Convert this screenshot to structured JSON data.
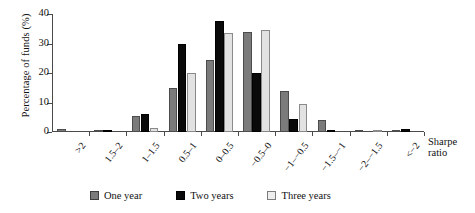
{
  "chart_data": {
    "type": "bar",
    "title": "",
    "xlabel": "Sharpe ratio",
    "ylabel": "Percentage of funds (%)",
    "ylim": [
      0,
      40
    ],
    "yticks": [
      0,
      10,
      20,
      30,
      40
    ],
    "grid": false,
    "legend_position": "bottom",
    "categories": [
      ">2",
      "1.5–2",
      "1–1.5",
      "0.5–1",
      "0–0.5",
      "−0.5–0",
      "−1–−0.5",
      "−1.5–−1",
      "−2–−1.5",
      "<−2"
    ],
    "series": [
      {
        "name": "One year",
        "color": "#7b7b7b",
        "values": [
          1.0,
          0.7,
          5.5,
          15.0,
          24.5,
          34.0,
          14.0,
          4.0,
          0.8,
          0.7
        ]
      },
      {
        "name": "Two years",
        "color": "#0a0a0a",
        "values": [
          0.0,
          0.6,
          6.0,
          30.0,
          37.5,
          20.0,
          4.5,
          0.4,
          0.0,
          1.0
        ]
      },
      {
        "name": "Three years",
        "color": "#e2e2e2",
        "values": [
          0.0,
          0.0,
          1.5,
          20.0,
          33.5,
          34.5,
          9.5,
          0.0,
          0.8,
          0.0
        ]
      }
    ]
  },
  "axis": {
    "y_title": "Percentage of funds (%)",
    "x_title_line1": "Sharpe",
    "x_title_line2": "ratio"
  },
  "legend": {
    "items": [
      {
        "label": "One year"
      },
      {
        "label": "Two years"
      },
      {
        "label": "Three years"
      }
    ]
  }
}
